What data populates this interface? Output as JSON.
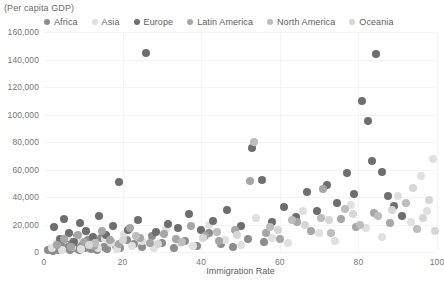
{
  "title": "(Per capita GDP)",
  "xlabel": "Immigration Rate",
  "legend": {
    "items": [
      {
        "label": "Africa",
        "color": "#8c8c8c"
      },
      {
        "label": "Asia",
        "color": "#e0e0e0"
      },
      {
        "label": "Europe",
        "color": "#6e6e6e"
      },
      {
        "label": "Latin America",
        "color": "#a6a6a6"
      },
      {
        "label": "North America",
        "color": "#bdbdbd"
      },
      {
        "label": "Oceania",
        "color": "#d6d6d6"
      }
    ]
  },
  "axes": {
    "y_ticks": [
      "0",
      "20,000",
      "40,000",
      "60,000",
      "80,000",
      "100,000",
      "120,000",
      "140,000",
      "160,000"
    ],
    "x_ticks": [
      "0",
      "20",
      "40",
      "60",
      "80",
      "100"
    ]
  },
  "chart_data": {
    "type": "scatter",
    "title": "(Per capita GDP)",
    "xlabel": "Immigration Rate",
    "ylabel": "(Per capita GDP)",
    "xlim": [
      0,
      100
    ],
    "ylim": [
      0,
      160000
    ],
    "xticks": [
      0,
      20,
      40,
      60,
      80,
      100
    ],
    "yticks": [
      0,
      20000,
      40000,
      60000,
      80000,
      100000,
      120000,
      140000,
      160000
    ],
    "grid": true,
    "legend_position": "top",
    "marker_radius_px": 4,
    "series": [
      {
        "name": "Africa",
        "color": "#8c8c8c",
        "points": [
          [
            1.0,
            1200
          ],
          [
            1.8,
            2400
          ],
          [
            2.4,
            800
          ],
          [
            3.0,
            4200
          ],
          [
            3.6,
            1500
          ],
          [
            4.2,
            6800
          ],
          [
            4.8,
            2100
          ],
          [
            5.4,
            9500
          ],
          [
            6.0,
            3300
          ],
          [
            6.6,
            1100
          ],
          [
            7.2,
            7400
          ],
          [
            7.8,
            2600
          ],
          [
            8.4,
            12000
          ],
          [
            9.0,
            1800
          ],
          [
            9.6,
            5200
          ],
          [
            10.4,
            3100
          ],
          [
            11.2,
            8600
          ],
          [
            12.0,
            2200
          ],
          [
            12.8,
            6000
          ],
          [
            13.6,
            1400
          ],
          [
            14.4,
            10500
          ],
          [
            15.2,
            3800
          ],
          [
            16.0,
            2000
          ],
          [
            17.0,
            7200
          ],
          [
            18.2,
            4500
          ],
          [
            19.4,
            2800
          ],
          [
            21.0,
            9000
          ],
          [
            23.0,
            5600
          ],
          [
            25.0,
            3400
          ],
          [
            27.5,
            11500
          ],
          [
            30.0,
            6400
          ],
          [
            33.0,
            2900
          ],
          [
            36.0,
            8200
          ],
          [
            39.0,
            4100
          ],
          [
            42.0,
            13500
          ],
          [
            45.0,
            5800
          ],
          [
            48.0,
            3600
          ],
          [
            52.0,
            9800
          ],
          [
            56.0,
            7000
          ]
        ]
      },
      {
        "name": "Asia",
        "color": "#e0e0e0",
        "points": [
          [
            2.0,
            2800
          ],
          [
            3.4,
            6500
          ],
          [
            4.6,
            1700
          ],
          [
            5.8,
            11000
          ],
          [
            7.0,
            3900
          ],
          [
            8.2,
            8800
          ],
          [
            9.4,
            2300
          ],
          [
            10.8,
            14500
          ],
          [
            12.2,
            5100
          ],
          [
            13.8,
            3000
          ],
          [
            15.4,
            9700
          ],
          [
            17.0,
            6200
          ],
          [
            18.6,
            2500
          ],
          [
            20.4,
            12800
          ],
          [
            22.5,
            4700
          ],
          [
            25.0,
            7900
          ],
          [
            28.0,
            3200
          ],
          [
            31.0,
            16500
          ],
          [
            34.5,
            6900
          ],
          [
            38.0,
            4300
          ],
          [
            42.0,
            19500
          ],
          [
            46.0,
            8400
          ],
          [
            50.0,
            5400
          ],
          [
            54.0,
            25000
          ],
          [
            58.0,
            10200
          ],
          [
            62.0,
            6600
          ],
          [
            66.0,
            29500
          ],
          [
            70.0,
            13800
          ],
          [
            74.0,
            8000
          ],
          [
            78.0,
            34500
          ],
          [
            82.0,
            17500
          ],
          [
            86.0,
            11200
          ],
          [
            90.0,
            40500
          ],
          [
            93.5,
            22000
          ],
          [
            96.0,
            55000
          ],
          [
            97.5,
            30000
          ],
          [
            99.0,
            68000
          ]
        ]
      },
      {
        "name": "Europe",
        "color": "#6e6e6e",
        "points": [
          [
            2.6,
            18500
          ],
          [
            4.0,
            9200
          ],
          [
            5.2,
            24000
          ],
          [
            6.4,
            13500
          ],
          [
            7.6,
            7600
          ],
          [
            9.2,
            21000
          ],
          [
            10.6,
            15500
          ],
          [
            12.4,
            10800
          ],
          [
            14.0,
            26500
          ],
          [
            15.8,
            12200
          ],
          [
            17.6,
            19000
          ],
          [
            19.2,
            51000
          ],
          [
            21.5,
            16000
          ],
          [
            24.0,
            23500
          ],
          [
            26.0,
            145000
          ],
          [
            28.5,
            14200
          ],
          [
            31.5,
            20500
          ],
          [
            34.0,
            17200
          ],
          [
            37.0,
            28000
          ],
          [
            40.0,
            15800
          ],
          [
            43.0,
            22500
          ],
          [
            46.5,
            30500
          ],
          [
            50.0,
            18800
          ],
          [
            53.0,
            76000
          ],
          [
            55.5,
            52500
          ],
          [
            58.0,
            21500
          ],
          [
            61.0,
            33000
          ],
          [
            64.0,
            25500
          ],
          [
            67.0,
            44000
          ],
          [
            69.5,
            30000
          ],
          [
            72.0,
            48500
          ],
          [
            74.5,
            36000
          ],
          [
            77.0,
            57500
          ],
          [
            79.0,
            42000
          ],
          [
            81.0,
            110000
          ],
          [
            82.5,
            95000
          ],
          [
            83.5,
            66000
          ],
          [
            84.5,
            144000
          ],
          [
            86.0,
            58000
          ],
          [
            87.5,
            40500
          ],
          [
            89.0,
            33500
          ],
          [
            91.0,
            26500
          ]
        ]
      },
      {
        "name": "Latin America",
        "color": "#a6a6a6",
        "points": [
          [
            3.2,
            5400
          ],
          [
            5.0,
            9800
          ],
          [
            6.8,
            3700
          ],
          [
            8.6,
            12500
          ],
          [
            10.2,
            7100
          ],
          [
            12.6,
            4600
          ],
          [
            14.8,
            15000
          ],
          [
            16.8,
            8900
          ],
          [
            19.0,
            5900
          ],
          [
            21.8,
            17500
          ],
          [
            24.5,
            10400
          ],
          [
            27.0,
            6700
          ],
          [
            30.5,
            13200
          ],
          [
            33.5,
            9100
          ],
          [
            37.5,
            19000
          ],
          [
            41.0,
            11800
          ],
          [
            44.5,
            7800
          ],
          [
            48.5,
            16200
          ],
          [
            52.5,
            52000
          ],
          [
            56.5,
            13600
          ],
          [
            60.0,
            9400
          ],
          [
            64.5,
            21500
          ],
          [
            68.0,
            15200
          ],
          [
            71.0,
            45500
          ],
          [
            75.5,
            24000
          ],
          [
            79.5,
            18000
          ],
          [
            84.0,
            28500
          ],
          [
            88.0,
            21000
          ]
        ]
      },
      {
        "name": "North America",
        "color": "#bdbdbd",
        "points": [
          [
            13.0,
            6300
          ],
          [
            23.5,
            11900
          ],
          [
            35.0,
            7500
          ],
          [
            44.0,
            14800
          ],
          [
            53.5,
            80000
          ],
          [
            57.5,
            18500
          ],
          [
            63.0,
            23000
          ],
          [
            70.5,
            24500
          ],
          [
            73.0,
            14000
          ],
          [
            76.5,
            31000
          ],
          [
            80.5,
            19500
          ],
          [
            85.0,
            26000
          ],
          [
            92.0,
            35500
          ],
          [
            95.0,
            17000
          ]
        ]
      },
      {
        "name": "Oceania",
        "color": "#d6d6d6",
        "points": [
          [
            11.5,
            4900
          ],
          [
            20.0,
            8700
          ],
          [
            29.0,
            5500
          ],
          [
            40.5,
            10000
          ],
          [
            49.0,
            12600
          ],
          [
            59.5,
            15800
          ],
          [
            66.5,
            20000
          ],
          [
            72.5,
            23500
          ],
          [
            78.5,
            28000
          ],
          [
            88.5,
            30500
          ],
          [
            94.0,
            46500
          ],
          [
            96.5,
            24500
          ],
          [
            98.0,
            38000
          ],
          [
            99.5,
            15500
          ]
        ]
      }
    ]
  }
}
